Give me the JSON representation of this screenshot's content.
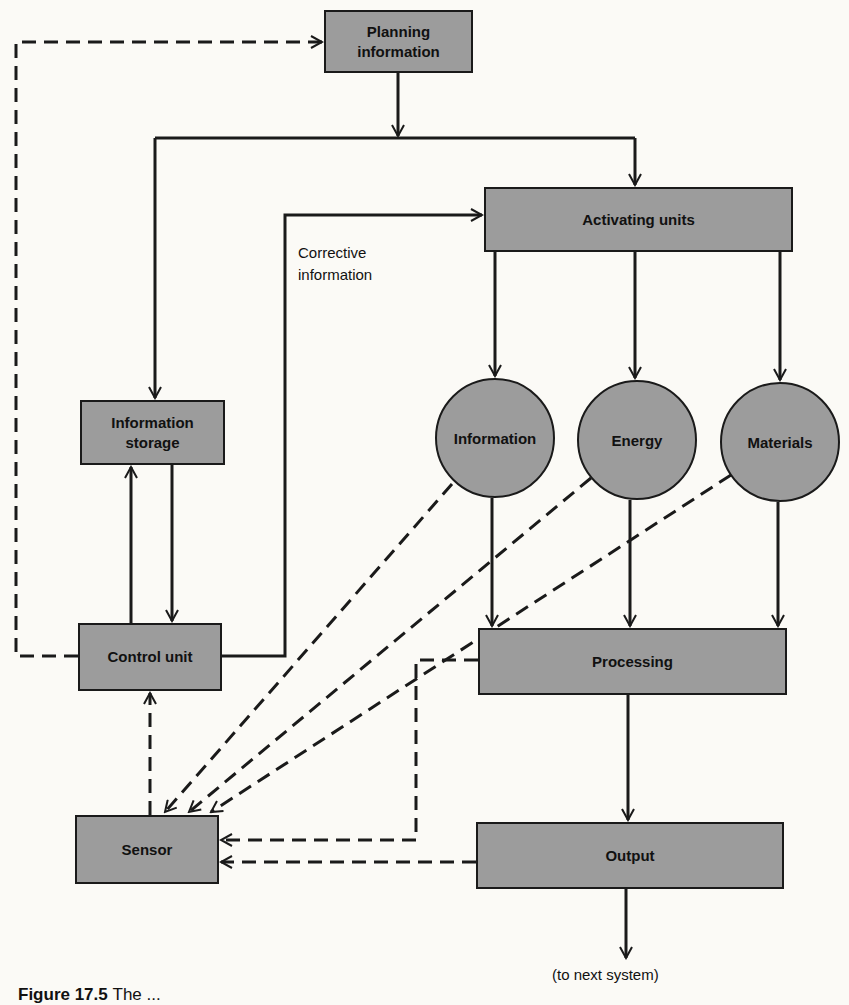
{
  "diagram": {
    "nodes": {
      "planning_information": "Planning\ninformation",
      "activating_units": "Activating units",
      "information_storage": "Information\nstorage",
      "control_unit": "Control unit",
      "information": "Information",
      "energy": "Energy",
      "materials": "Materials",
      "processing": "Processing",
      "output": "Output",
      "sensor": "Sensor"
    },
    "labels": {
      "corrective_information": "Corrective\ninformation",
      "to_next_system": "(to next system)"
    },
    "caption": {
      "number": "Figure 17.5",
      "text": "The ..."
    },
    "edges": [
      {
        "from": "Planning information",
        "to": "Activating units",
        "style": "solid"
      },
      {
        "from": "Planning information",
        "to": "Information storage",
        "style": "solid"
      },
      {
        "from": "Information storage",
        "to": "Control unit",
        "style": "solid"
      },
      {
        "from": "Control unit",
        "to": "Information storage",
        "style": "solid"
      },
      {
        "from": "Control unit",
        "to": "Activating units",
        "style": "solid",
        "label": "Corrective information"
      },
      {
        "from": "Control unit",
        "to": "Planning information",
        "style": "dashed"
      },
      {
        "from": "Activating units",
        "to": "Information",
        "style": "solid"
      },
      {
        "from": "Activating units",
        "to": "Energy",
        "style": "solid"
      },
      {
        "from": "Activating units",
        "to": "Materials",
        "style": "solid"
      },
      {
        "from": "Information",
        "to": "Processing",
        "style": "solid"
      },
      {
        "from": "Energy",
        "to": "Processing",
        "style": "solid"
      },
      {
        "from": "Materials",
        "to": "Processing",
        "style": "solid"
      },
      {
        "from": "Processing",
        "to": "Output",
        "style": "solid"
      },
      {
        "from": "Output",
        "to": "(to next system)",
        "style": "solid"
      },
      {
        "from": "Information",
        "to": "Sensor",
        "style": "dashed"
      },
      {
        "from": "Energy",
        "to": "Sensor",
        "style": "dashed"
      },
      {
        "from": "Materials",
        "to": "Sensor",
        "style": "dashed"
      },
      {
        "from": "Processing",
        "to": "Sensor",
        "style": "dashed"
      },
      {
        "from": "Output",
        "to": "Sensor",
        "style": "dashed"
      },
      {
        "from": "Sensor",
        "to": "Control unit",
        "style": "dashed"
      }
    ],
    "colors": {
      "node_fill": "#9c9c9c",
      "stroke": "#1a1a1a",
      "background": "#fbfaf6"
    }
  }
}
